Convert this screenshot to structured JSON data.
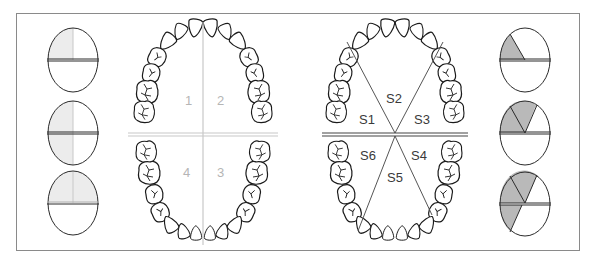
{
  "figure": {
    "colors": {
      "outline": "#2a2a2a",
      "frame": "#8a8a8a",
      "quadrant_line": "#c8c8c8",
      "quadrant_fill": "#ececec",
      "sextant_fill": "#b9b9b9",
      "sextant_line": "#555555"
    },
    "left_icons": [
      {
        "label": "one-quadrant",
        "shaded": "upper-left quarter"
      },
      {
        "label": "two-quadrants-left",
        "shaded": "left half"
      },
      {
        "label": "two-quadrants-upper",
        "shaded": "upper half"
      }
    ],
    "quadrant_chart": {
      "labels": [
        "1",
        "2",
        "3",
        "4"
      ]
    },
    "sextant_chart": {
      "labels": [
        "S1",
        "S2",
        "S3",
        "S4",
        "S5",
        "S6"
      ]
    },
    "right_icons": [
      {
        "label": "one-sextant",
        "shaded": "S1"
      },
      {
        "label": "two-sextants",
        "shaded": "S1, S2"
      },
      {
        "label": "three-sextants",
        "shaded": "S1, S2, S6"
      }
    ]
  }
}
